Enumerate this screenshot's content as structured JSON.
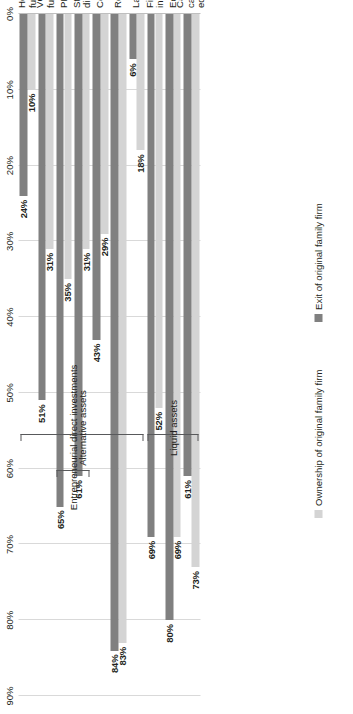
{
  "chart_data": {
    "type": "bar",
    "orientation": "horizontal-rotated",
    "title": "",
    "xlabel": "",
    "ylabel": "",
    "ylim": [
      0,
      90
    ],
    "grid": true,
    "legend_position": "bottom",
    "categories": [
      "Cash and cash\nequivalents",
      "Equities",
      "Fixed income",
      "Land",
      "Real estate",
      "Commodities",
      "Start-up direct",
      "PE direct",
      "VC/ PE funds",
      "Hedge funds"
    ],
    "tick_labels": [
      "0%",
      "10%",
      "20%",
      "30%",
      "40%",
      "50%",
      "60%",
      "70%",
      "80%",
      "90%"
    ],
    "tick_values": [
      0,
      10,
      20,
      30,
      40,
      50,
      60,
      70,
      80,
      90
    ],
    "series": [
      {
        "name": "Ownership of original family firm",
        "color": "#d4d4d4",
        "values": [
          73,
          69,
          52,
          18,
          83,
          29,
          31,
          35,
          31,
          10
        ],
        "labels": [
          "73%",
          "69%",
          "52%",
          "18%",
          "83%",
          "29%",
          "31%",
          "35%",
          "31%",
          "10%"
        ]
      },
      {
        "name": "Exit of original family firm",
        "color": "#808080",
        "values": [
          61,
          80,
          69,
          6,
          84,
          43,
          61,
          65,
          51,
          24
        ],
        "labels": [
          "61%",
          "80%",
          "69%",
          "6%",
          "84%",
          "43%",
          "61%",
          "65%",
          "51%",
          "24%"
        ]
      }
    ],
    "group_brackets": [
      {
        "label": "Liquid assets",
        "from": 0,
        "to": 2
      },
      {
        "label": "Alternative assets",
        "from": 3,
        "to": 9
      },
      {
        "label": "Entrepreneurial direct investments",
        "from": 6,
        "to": 7
      }
    ]
  },
  "legend": {
    "items": [
      {
        "label": "Ownership of original family firm",
        "color": "#d4d4d4"
      },
      {
        "label": "Exit of original family firm",
        "color": "#808080"
      }
    ]
  }
}
